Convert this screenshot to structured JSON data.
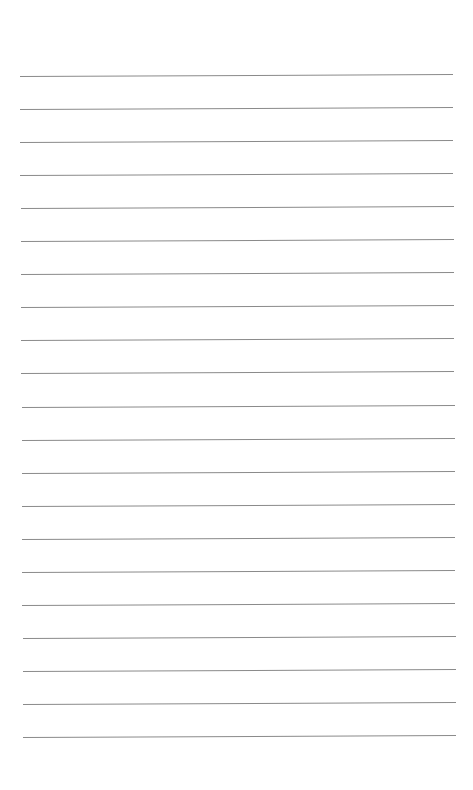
{
  "page": {
    "type": "lined-paper",
    "background": "#ffffff",
    "line_color": "#8a8a8a",
    "line_count": 21,
    "first_line_y": 76,
    "line_spacing": 33.05,
    "line_left": 20,
    "line_width": 433
  }
}
